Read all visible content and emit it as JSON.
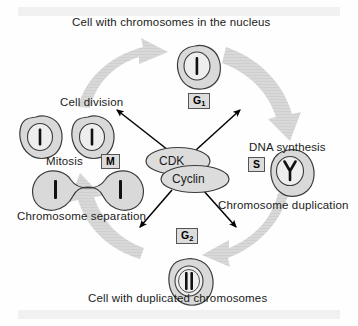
{
  "diagram": {
    "type": "cycle-diagram",
    "background_color": "#fefefe",
    "band_color": "#f1f1f1",
    "cell_fill": "#d9d9d9",
    "cell_stroke": "#3c3c3c",
    "arrow_fill": "#d6d6d6",
    "black_arrow_color": "#000000",
    "phase_box_fill": "#dcdcdc"
  },
  "captions": {
    "top": "Cell with chromosomes in the nucleus",
    "bottom": "Cell with duplicated chromosomes",
    "cell_division": "Cell division",
    "dna_synthesis": "DNA synthesis",
    "mitosis": "Mitosis",
    "chromosome_separation": "Chromosome separation",
    "chromosome_duplication": "Chromosome duplication"
  },
  "complex": {
    "cdk_label": "CDK",
    "cyclin_label": "Cyclin"
  },
  "phases": [
    {
      "id": "g1",
      "letter": "G",
      "subscript": "1",
      "full": "G1",
      "position": "top",
      "cell_state": "single chromosome in nucleus"
    },
    {
      "id": "s",
      "letter": "S",
      "subscript": "",
      "full": "S",
      "position": "right",
      "cell_state": "replicating Y-shaped chromosome"
    },
    {
      "id": "g2",
      "letter": "G",
      "subscript": "2",
      "full": "G2",
      "position": "bottom",
      "cell_state": "two duplicated chromosomes"
    },
    {
      "id": "m",
      "letter": "M",
      "subscript": "",
      "full": "M",
      "position": "left",
      "cell_state": "dividing cell, chromosomes separating"
    }
  ],
  "cells": [
    {
      "name": "g1-cell",
      "chromosomes": 1,
      "shape": "round-blob"
    },
    {
      "name": "s-cell",
      "chromosomes": 1,
      "shape": "round-blob",
      "chromosome_form": "Y"
    },
    {
      "name": "g2-cell",
      "chromosomes": 2,
      "shape": "round-blob"
    },
    {
      "name": "mitosis-cell",
      "chromosomes": 2,
      "shape": "dumbbell"
    },
    {
      "name": "daughter-cell-left",
      "chromosomes": 1,
      "shape": "round-blob"
    },
    {
      "name": "daughter-cell-right",
      "chromosomes": 1,
      "shape": "round-blob"
    }
  ],
  "cycle_arrows": [
    {
      "name": "arrow-m-to-g1",
      "direction": "up-right",
      "quadrant": "top-left"
    },
    {
      "name": "arrow-g1-to-s",
      "direction": "down-right",
      "quadrant": "top-right"
    },
    {
      "name": "arrow-s-to-g2",
      "direction": "down-left",
      "quadrant": "bottom-right"
    },
    {
      "name": "arrow-g2-to-m",
      "direction": "up-left",
      "quadrant": "bottom-left"
    }
  ],
  "radial_arrows": [
    {
      "name": "cdk-arrow-to-cell-division",
      "direction": "up-left"
    },
    {
      "name": "cdk-arrow-to-dna-synthesis",
      "direction": "up-right"
    },
    {
      "name": "cdk-arrow-to-chromosome-separation",
      "direction": "down-left"
    },
    {
      "name": "cdk-arrow-to-g2",
      "direction": "down-right"
    }
  ]
}
